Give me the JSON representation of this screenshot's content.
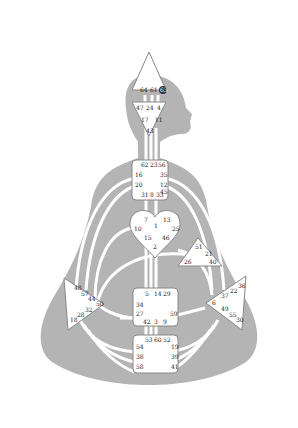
{
  "colors": {
    "silhouette": "#b4b4b4",
    "channel": "#ffffff",
    "center_fill": "#ffffff",
    "center_stroke": "#888888",
    "text": "#222222",
    "highlight": "#333333"
  },
  "centers": {
    "head": {
      "gates": [
        "64",
        "61",
        "63"
      ],
      "highlighted_gate": "63"
    },
    "ajna": {
      "gates": [
        "47",
        "24",
        "4",
        "17",
        "11",
        "43"
      ]
    },
    "throat": {
      "gates": [
        "62",
        "23",
        "56",
        "16",
        "35",
        "20",
        "12",
        "45",
        "31",
        "8",
        "33"
      ]
    },
    "g": {
      "gates": [
        "7",
        "1",
        "13",
        "10",
        "25",
        "15",
        "46",
        "2"
      ]
    },
    "heart": {
      "gates": [
        "51",
        "21",
        "26",
        "40"
      ]
    },
    "spleen": {
      "gates": [
        "48",
        "57",
        "44",
        "50",
        "32",
        "28",
        "18"
      ]
    },
    "solar_plexus": {
      "gates": [
        "36",
        "22",
        "37",
        "6",
        "49",
        "55",
        "30"
      ]
    },
    "sacral": {
      "gates": [
        "5",
        "14",
        "29",
        "34",
        "27",
        "59",
        "42",
        "3",
        "9"
      ]
    },
    "root": {
      "gates": [
        "53",
        "60",
        "52",
        "54",
        "19",
        "38",
        "39",
        "58",
        "41"
      ]
    }
  }
}
